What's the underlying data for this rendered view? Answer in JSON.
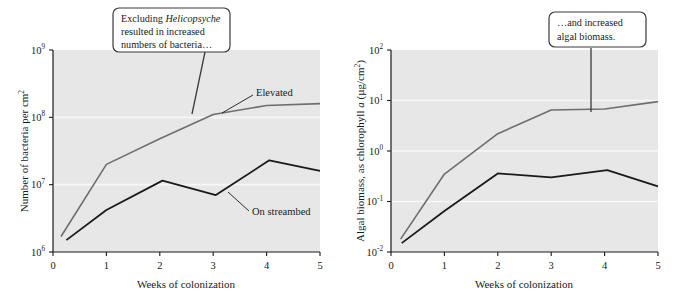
{
  "figure": {
    "background_color": "#ffffff",
    "plot_background_color": "#e7e7e7",
    "gridline_color": "#f7f7f7",
    "axis_color": "#1a1a1a",
    "series_colors": {
      "elevated": "#6e6e6e",
      "on_streambed": "#1a1a1a"
    }
  },
  "panels": [
    {
      "id": "bacteria",
      "callout": {
        "line1_prefix": "Excluding ",
        "line1_italic": "Helicopsyche",
        "line2": "resulted in increased",
        "line3": "numbers of bacteria…"
      },
      "series_labels": {
        "elevated": "Elevated",
        "on_streambed": "On streambed"
      },
      "chart_data": {
        "type": "line",
        "title": "",
        "xlabel": "Weeks of colonization",
        "ylabel": "Number of bacteria per cm",
        "ylabel_sup": "2",
        "xlim": [
          0,
          5
        ],
        "ylim": [
          1000000,
          1000000000
        ],
        "yscale": "log",
        "grid": true,
        "legend_position": "inline-annotation",
        "xticks": [
          "0",
          "1",
          "2",
          "3",
          "4",
          "5"
        ],
        "xtick_values": [
          0,
          1,
          2,
          3,
          4,
          5
        ],
        "yticks": [
          {
            "base": "10",
            "exp": "6",
            "value": 1000000
          },
          {
            "base": "10",
            "exp": "7",
            "value": 10000000
          },
          {
            "base": "10",
            "exp": "8",
            "value": 100000000
          },
          {
            "base": "10",
            "exp": "9",
            "value": 1000000000
          }
        ],
        "series": [
          {
            "name": "Elevated",
            "color": "#6e6e6e",
            "x": [
              0.15,
              1.0,
              2.0,
              3.0,
              4.0,
              5.0
            ],
            "values": [
              1700000,
              20000000,
              48000000,
              110000000.0,
              150000000.0,
              160000000.0
            ]
          },
          {
            "name": "On streambed",
            "color": "#1a1a1a",
            "x": [
              0.25,
              1.0,
              2.05,
              3.05,
              4.05,
              5.0
            ],
            "values": [
              1500000,
              4200000,
              11500000,
              7000000,
              23000000,
              16000000
            ]
          }
        ]
      }
    },
    {
      "id": "algae",
      "callout": {
        "line1": "…and increased",
        "line2": "algal biomass."
      },
      "chart_data": {
        "type": "line",
        "title": "",
        "xlabel": "Weeks of colonization",
        "ylabel_part1": "Algal biomass, as chlorophyll ",
        "ylabel_italic": "a",
        "ylabel_part2": " (µg/cm",
        "ylabel_sup": "2",
        "ylabel_part3": ")",
        "xlim": [
          0,
          5
        ],
        "ylim": [
          0.01,
          100
        ],
        "yscale": "log",
        "grid": true,
        "legend_position": "none",
        "xticks": [
          "0",
          "1",
          "2",
          "3",
          "4",
          "5"
        ],
        "xtick_values": [
          0,
          1,
          2,
          3,
          4,
          5
        ],
        "yticks": [
          {
            "base": "10",
            "exp": "-2",
            "value": 0.01
          },
          {
            "base": "10",
            "exp": "-1",
            "value": 0.1
          },
          {
            "base": "10",
            "exp": "0",
            "value": 1
          },
          {
            "base": "10",
            "exp": "1",
            "value": 10
          },
          {
            "base": "10",
            "exp": "2",
            "value": 100
          }
        ],
        "series": [
          {
            "name": "Elevated",
            "color": "#6e6e6e",
            "x": [
              0.18,
              1.0,
              2.0,
              3.0,
              4.0,
              5.0
            ],
            "values": [
              0.018,
              0.35,
              2.2,
              6.5,
              6.8,
              9.5
            ]
          },
          {
            "name": "On streambed",
            "color": "#1a1a1a",
            "x": [
              0.2,
              1.0,
              2.0,
              3.0,
              4.05,
              5.0
            ],
            "values": [
              0.015,
              0.065,
              0.36,
              0.3,
              0.42,
              0.2
            ]
          }
        ]
      }
    }
  ]
}
